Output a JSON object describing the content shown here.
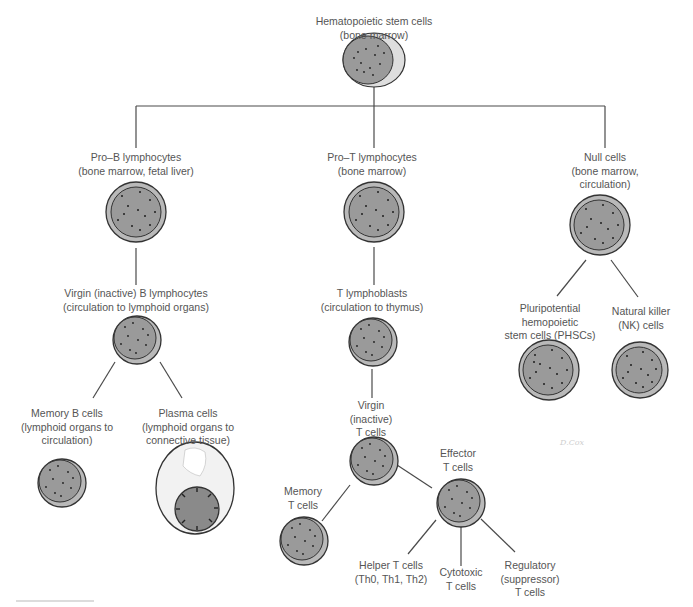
{
  "diagram": {
    "colors": {
      "line": "#4a4a4a",
      "cell_outer": "#b9b9b9",
      "cell_inner": "#9a9a9a",
      "text": "#555555",
      "plasma_cytoplasm": "#f2f2f2"
    },
    "nodes": {
      "hsc": {
        "lines": [
          "Hematopoietic stem cells",
          "(bone marrow)"
        ]
      },
      "pro_b": {
        "lines": [
          "Pro–B lymphocytes",
          "(bone marrow, fetal liver)"
        ]
      },
      "pro_t": {
        "lines": [
          "Pro–T lymphocytes",
          "(bone marrow)"
        ]
      },
      "null": {
        "lines": [
          "Null cells",
          "(bone marrow,",
          "circulation)"
        ]
      },
      "virgin_b": {
        "lines": [
          "Virgin (inactive)  B lymphocytes",
          "(circulation to lymphoid organs)"
        ]
      },
      "t_blast": {
        "lines": [
          "T lymphoblasts",
          "(circulation to thymus)"
        ]
      },
      "phsc": {
        "lines": [
          "Pluripotential",
          "hemopoietic",
          "stem cells (PHSCs)"
        ]
      },
      "nk": {
        "lines": [
          "Natural killer",
          "(NK) cells"
        ]
      },
      "memory_b": {
        "lines": [
          "Memory B cells",
          "(lymphoid organs to",
          "circulation)"
        ]
      },
      "plasma": {
        "lines": [
          "Plasma cells",
          "(lymphoid organs to",
          "connective tissue)"
        ]
      },
      "virgin_t": {
        "lines": [
          "Virgin",
          "(inactive)",
          "T cells"
        ]
      },
      "effector_t": {
        "lines": [
          "Effector",
          "T cells"
        ]
      },
      "memory_t": {
        "lines": [
          "Memory",
          "T cells"
        ]
      },
      "helper_t": {
        "lines": [
          "Helper T cells",
          "(Th0, Th1, Th2)"
        ]
      },
      "cytotoxic_t": {
        "lines": [
          "Cytotoxic",
          "T cells"
        ]
      },
      "regulatory_t": {
        "lines": [
          "Regulatory",
          "(suppressor)",
          "T cells"
        ]
      }
    },
    "edges": [
      [
        "hsc",
        "pro_b"
      ],
      [
        "hsc",
        "pro_t"
      ],
      [
        "hsc",
        "null"
      ],
      [
        "pro_b",
        "virgin_b"
      ],
      [
        "pro_t",
        "t_blast"
      ],
      [
        "null",
        "phsc"
      ],
      [
        "null",
        "nk"
      ],
      [
        "virgin_b",
        "memory_b"
      ],
      [
        "virgin_b",
        "plasma"
      ],
      [
        "t_blast",
        "virgin_t"
      ],
      [
        "virgin_t",
        "memory_t"
      ],
      [
        "virgin_t",
        "effector_t"
      ],
      [
        "effector_t",
        "helper_t"
      ],
      [
        "effector_t",
        "cytotoxic_t"
      ],
      [
        "effector_t",
        "regulatory_t"
      ]
    ],
    "signature": "D.Cox"
  }
}
